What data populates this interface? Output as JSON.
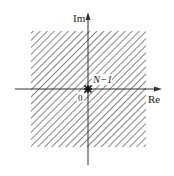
{
  "diagram": {
    "type": "complex-plane-region-of-convergence",
    "axes": {
      "imaginary_label": "Im",
      "real_label": "Re",
      "origin_label": "0"
    },
    "pole": {
      "label": "N−1",
      "position": "origin",
      "marker": "star"
    },
    "region": {
      "fill": "hatched",
      "description": "entire plane (square shaded region) excluding origin"
    },
    "colors": {
      "axis": "#333333",
      "hatch": "#555555",
      "background": "#ffffff"
    }
  }
}
